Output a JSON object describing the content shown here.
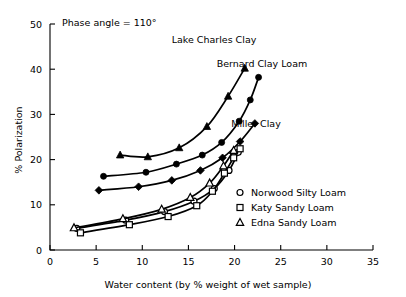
{
  "chart_data": {
    "type": "line",
    "title": "Phase angle = 110°",
    "xlabel": "Water content  (by % weight of wet sample)",
    "ylabel": "% Polarization",
    "xlim": [
      0,
      35
    ],
    "ylim": [
      0,
      50
    ],
    "xticks": [
      "0",
      "5",
      "10",
      "15",
      "20",
      "25",
      "30",
      "35"
    ],
    "xtick_values": [
      0,
      5,
      10,
      15,
      20,
      25,
      30,
      35
    ],
    "yticks": [
      "0",
      "10",
      "20",
      "30",
      "40",
      "50"
    ],
    "ytick_values": [
      0,
      10,
      20,
      30,
      40,
      50
    ],
    "grid": false,
    "legend_position": "inside-right",
    "series": [
      {
        "name": "Lake Charles Clay",
        "marker": "filled-triangle",
        "label_placement": "curve-top-left",
        "points": [
          {
            "x": 7.6,
            "y": 21.0
          },
          {
            "x": 10.6,
            "y": 20.6
          },
          {
            "x": 14.0,
            "y": 22.6
          },
          {
            "x": 17.0,
            "y": 27.3
          },
          {
            "x": 19.3,
            "y": 34.0
          },
          {
            "x": 21.1,
            "y": 40.2
          }
        ]
      },
      {
        "name": "Bernard Clay Loam",
        "marker": "filled-circle",
        "label_placement": "curve-top-right",
        "points": [
          {
            "x": 5.8,
            "y": 16.3
          },
          {
            "x": 10.4,
            "y": 17.2
          },
          {
            "x": 13.7,
            "y": 19.0
          },
          {
            "x": 16.5,
            "y": 21.0
          },
          {
            "x": 18.6,
            "y": 23.8
          },
          {
            "x": 20.5,
            "y": 28.5
          },
          {
            "x": 21.7,
            "y": 33.2
          },
          {
            "x": 22.6,
            "y": 38.2
          }
        ]
      },
      {
        "name": "Miller Clay",
        "marker": "filled-diamond",
        "label_placement": "curve-middle-right",
        "points": [
          {
            "x": 5.3,
            "y": 13.2
          },
          {
            "x": 9.6,
            "y": 14.0
          },
          {
            "x": 13.2,
            "y": 15.4
          },
          {
            "x": 16.3,
            "y": 17.6
          },
          {
            "x": 18.7,
            "y": 20.4
          },
          {
            "x": 20.6,
            "y": 24.0
          },
          {
            "x": 22.2,
            "y": 28.0
          }
        ]
      },
      {
        "name": "Norwood Silty Loam",
        "marker": "open-circle",
        "label_placement": "legend",
        "points": [
          {
            "x": 2.9,
            "y": 4.8
          },
          {
            "x": 8.2,
            "y": 6.6
          },
          {
            "x": 12.4,
            "y": 8.5
          },
          {
            "x": 15.6,
            "y": 10.8
          },
          {
            "x": 17.8,
            "y": 13.6
          },
          {
            "x": 19.4,
            "y": 17.6
          },
          {
            "x": 20.4,
            "y": 21.6
          }
        ]
      },
      {
        "name": "Katy Sandy Loam",
        "marker": "open-square",
        "label_placement": "legend",
        "points": [
          {
            "x": 3.3,
            "y": 3.8
          },
          {
            "x": 8.6,
            "y": 5.6
          },
          {
            "x": 12.8,
            "y": 7.4
          },
          {
            "x": 15.9,
            "y": 9.8
          },
          {
            "x": 17.6,
            "y": 13.0
          },
          {
            "x": 18.9,
            "y": 17.0
          },
          {
            "x": 19.9,
            "y": 20.4
          },
          {
            "x": 20.6,
            "y": 22.4
          }
        ]
      },
      {
        "name": "Edna Sandy Loam",
        "marker": "open-triangle",
        "label_placement": "legend",
        "points": [
          {
            "x": 2.6,
            "y": 4.9
          },
          {
            "x": 7.9,
            "y": 6.9
          },
          {
            "x": 12.1,
            "y": 9.0
          },
          {
            "x": 15.2,
            "y": 11.6
          },
          {
            "x": 17.3,
            "y": 14.8
          },
          {
            "x": 18.8,
            "y": 18.6
          },
          {
            "x": 19.9,
            "y": 22.0
          }
        ]
      }
    ],
    "curve_labels": [
      {
        "text": "Lake Charles Clay",
        "x": 214,
        "y": 43
      },
      {
        "text": "Bernard Clay Loam",
        "x": 262,
        "y": 67
      },
      {
        "text": "Miller Clay",
        "x": 256,
        "y": 127
      }
    ],
    "legend_entries": [
      {
        "marker": "open-circle",
        "label": "Norwood Silty Loam"
      },
      {
        "marker": "open-square",
        "label": "Katy Sandy Loam"
      },
      {
        "marker": "open-triangle",
        "label": "Edna Sandy Loam"
      }
    ],
    "colors": {
      "ink": "#000000",
      "background": "#ffffff"
    }
  }
}
